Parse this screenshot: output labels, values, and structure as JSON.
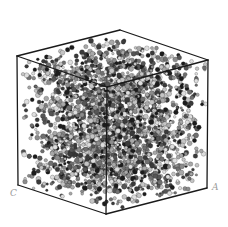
{
  "figure": {
    "labels": {
      "corner_left": "C",
      "corner_right": "A"
    },
    "cube": {
      "vertices": {
        "top_left": [
          17,
          56
        ],
        "top_back": [
          120,
          30
        ],
        "top_right": [
          208,
          60
        ],
        "top_front": [
          107,
          87
        ],
        "bottom_left": [
          18,
          185
        ],
        "bottom_front": [
          106,
          214
        ],
        "bottom_right": [
          207,
          188
        ]
      },
      "edge_color": "#1a1a1a",
      "edge_width": 1.3
    },
    "atoms": {
      "count": 2600,
      "seed": 7,
      "radius_min": 1.2,
      "radius_max": 2.6,
      "colors": [
        "#1c1c1c",
        "#3a3a3a",
        "#555555",
        "#707070",
        "#8c8c8c",
        "#a8a8a8",
        "#c4c4c4",
        "#dedede"
      ],
      "bond_color": "#5a5a5a"
    }
  }
}
